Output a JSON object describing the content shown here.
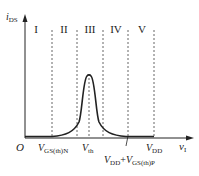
{
  "diagram": {
    "y_axis": {
      "label_main": "i",
      "label_sub": "DS"
    },
    "x_axis": {
      "label_main": "v",
      "label_sub": "I"
    },
    "origin": "O",
    "regions": [
      "I",
      "II",
      "III",
      "IV",
      "V"
    ],
    "ticks": [
      {
        "main": "V",
        "sub": "GS(th)N"
      },
      {
        "main": "V",
        "sub": "th"
      },
      {
        "main": "V",
        "sub": "DD",
        "plus": "+",
        "main2": "V",
        "sub2": "GS(th)P"
      },
      {
        "main": "V",
        "sub": "DD"
      }
    ],
    "colors": {
      "line": "#222222",
      "dash": "#555555"
    }
  }
}
